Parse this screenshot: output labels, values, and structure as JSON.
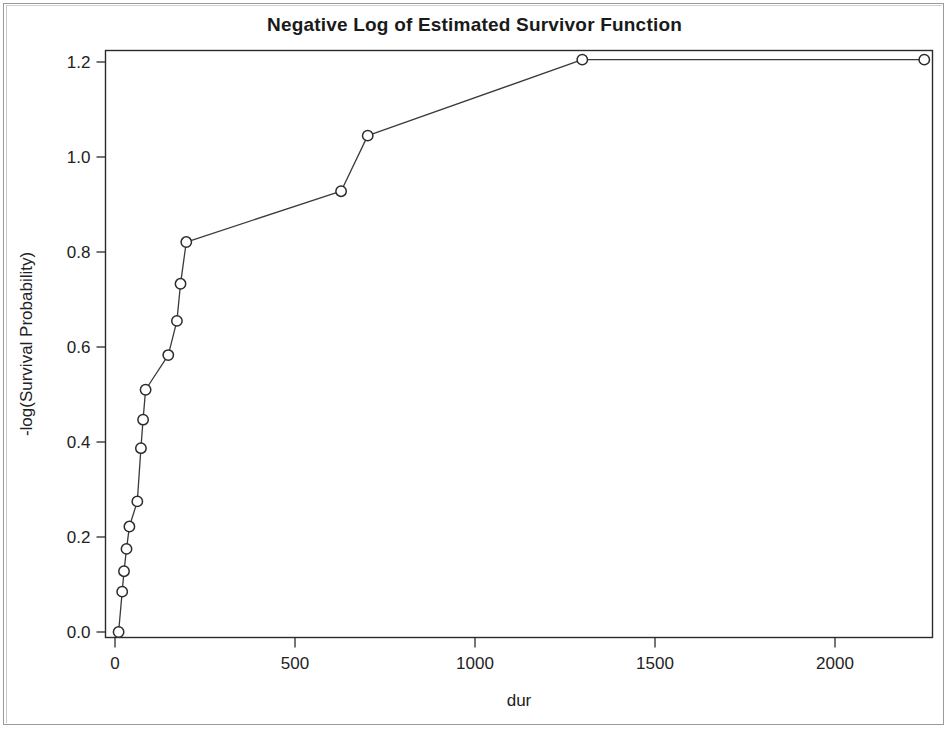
{
  "chart_data": {
    "type": "line",
    "title": "Negative Log of Estimated Survivor Function",
    "xlabel": "dur",
    "ylabel": "-log(Survival Probability)",
    "xlim": [
      -60,
      2300
    ],
    "ylim": [
      -0.035,
      1.245
    ],
    "grid": false,
    "legend": null,
    "marker": "open-circle",
    "line_color": "#3a3a3a",
    "marker_edge_color": "#2b2b2b",
    "marker_face_color": "#ffffff",
    "xticks": [
      0,
      500,
      1000,
      1500,
      2000
    ],
    "xtick_labels": [
      "0",
      "500",
      "1000",
      "1500",
      "2000"
    ],
    "yticks": [
      0.0,
      0.2,
      0.4,
      0.6,
      0.8,
      1.0,
      1.2
    ],
    "ytick_labels": [
      "0.0",
      "0.2",
      "0.4",
      "0.6",
      "0.8",
      "1.0",
      "1.2"
    ],
    "series": [
      {
        "name": "-log(S(t))",
        "x": [
          10,
          20,
          25,
          32,
          40,
          62,
          72,
          78,
          85,
          148,
          172,
          182,
          198,
          628,
          702,
          1298,
          2248
        ],
        "y": [
          0.0,
          0.085,
          0.128,
          0.175,
          0.222,
          0.275,
          0.387,
          0.447,
          0.51,
          0.583,
          0.655,
          0.733,
          0.821,
          0.928,
          1.045,
          1.205,
          1.205
        ]
      }
    ]
  },
  "figure": {
    "background_color": "#ffffff",
    "axis_color": "#2b2b2b",
    "border_color": "#9a9a9a"
  }
}
